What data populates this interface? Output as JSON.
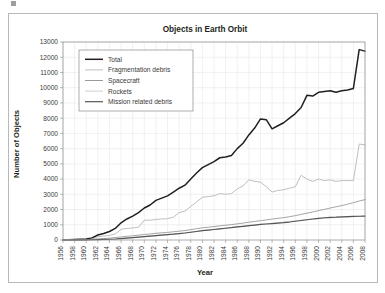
{
  "chart_data": {
    "type": "line",
    "title": "Objects in Earth Orbit",
    "xlabel": "Year",
    "ylabel": "Number of Objects",
    "xlim": [
      1956,
      2008
    ],
    "ylim": [
      0,
      13000
    ],
    "ytick_step": 1000,
    "xtick_step": 2,
    "grid": true,
    "legend_position": "top-left-inside",
    "xtick_labels": [
      "1956",
      "1958",
      "1960",
      "1962",
      "1964",
      "1966",
      "1968",
      "1970",
      "1972",
      "1974",
      "1976",
      "1978",
      "1980",
      "1982",
      "1984",
      "1986",
      "1988",
      "1990",
      "1992",
      "1994",
      "1996",
      "1998",
      "2000",
      "2002",
      "2004",
      "2006",
      "2008"
    ],
    "ytick_labels": [
      "0",
      "1000",
      "2000",
      "3000",
      "4000",
      "5000",
      "6000",
      "7000",
      "8000",
      "9000",
      "10000",
      "11000",
      "12000",
      "13000"
    ],
    "x": [
      1956,
      1957,
      1958,
      1959,
      1960,
      1961,
      1962,
      1963,
      1964,
      1965,
      1966,
      1967,
      1968,
      1969,
      1970,
      1971,
      1972,
      1973,
      1974,
      1975,
      1976,
      1977,
      1978,
      1979,
      1980,
      1981,
      1982,
      1983,
      1984,
      1985,
      1986,
      1987,
      1988,
      1989,
      1990,
      1991,
      1992,
      1993,
      1994,
      1995,
      1996,
      1997,
      1998,
      1999,
      2000,
      2001,
      2002,
      2003,
      2004,
      2005,
      2006,
      2007,
      2008
    ],
    "series": [
      {
        "name": "Total",
        "color": "#231f20",
        "width": 1.5,
        "values": [
          0,
          10,
          30,
          50,
          70,
          130,
          330,
          430,
          560,
          760,
          1130,
          1380,
          1570,
          1800,
          2100,
          2300,
          2600,
          2750,
          2900,
          3150,
          3400,
          3600,
          4000,
          4400,
          4750,
          4950,
          5150,
          5400,
          5450,
          5550,
          6000,
          6350,
          6900,
          7350,
          7950,
          7900,
          7300,
          7500,
          7700,
          8000,
          8300,
          8700,
          9500,
          9450,
          9700,
          9750,
          9800,
          9700,
          9800,
          9850,
          9950,
          12500,
          12400
        ]
      },
      {
        "name": "Fragmentation debris",
        "color": "#bfbfbf",
        "width": 1.0,
        "values": [
          0,
          0,
          0,
          0,
          0,
          60,
          220,
          260,
          300,
          400,
          700,
          760,
          790,
          840,
          1300,
          1300,
          1350,
          1380,
          1400,
          1500,
          1800,
          1900,
          2200,
          2500,
          2800,
          2850,
          2900,
          3050,
          3000,
          3050,
          3350,
          3550,
          3950,
          3850,
          3800,
          3500,
          3150,
          3250,
          3300,
          3400,
          3500,
          4250,
          4000,
          3850,
          4000,
          3900,
          3950,
          3850,
          3900,
          3900,
          3900,
          6300,
          6250
        ]
      },
      {
        "name": "Spacecraft",
        "color": "#9a9a9a",
        "width": 0.9,
        "values": [
          0,
          3,
          12,
          20,
          28,
          40,
          70,
          90,
          120,
          160,
          200,
          240,
          280,
          320,
          360,
          400,
          440,
          470,
          500,
          540,
          580,
          620,
          680,
          740,
          800,
          840,
          880,
          930,
          970,
          1010,
          1060,
          1110,
          1170,
          1220,
          1270,
          1320,
          1370,
          1420,
          1470,
          1530,
          1600,
          1680,
          1760,
          1840,
          1930,
          2010,
          2100,
          2180,
          2260,
          2350,
          2450,
          2560,
          2650
        ]
      },
      {
        "name": "Rockets",
        "color": "#cfcfcf",
        "width": 0.9,
        "values": [
          0,
          2,
          5,
          8,
          12,
          18,
          28,
          38,
          50,
          70,
          100,
          130,
          160,
          190,
          230,
          270,
          300,
          330,
          360,
          390,
          430,
          470,
          520,
          570,
          620,
          660,
          700,
          740,
          780,
          820,
          860,
          900,
          940,
          980,
          1020,
          1060,
          1100,
          1140,
          1180,
          1220,
          1260,
          1300,
          1340,
          1370,
          1400,
          1430,
          1450,
          1470,
          1490,
          1510,
          1530,
          1550,
          1570
        ]
      },
      {
        "name": "Mission related debris",
        "color": "#555555",
        "width": 1.2,
        "values": [
          0,
          1,
          4,
          7,
          11,
          16,
          25,
          35,
          48,
          66,
          95,
          125,
          155,
          185,
          220,
          255,
          290,
          320,
          350,
          380,
          420,
          460,
          510,
          560,
          610,
          650,
          690,
          730,
          770,
          810,
          860,
          900,
          940,
          980,
          1020,
          1050,
          1080,
          1110,
          1140,
          1180,
          1230,
          1280,
          1330,
          1380,
          1420,
          1460,
          1490,
          1500,
          1520,
          1540,
          1550,
          1560,
          1570
        ]
      }
    ]
  }
}
